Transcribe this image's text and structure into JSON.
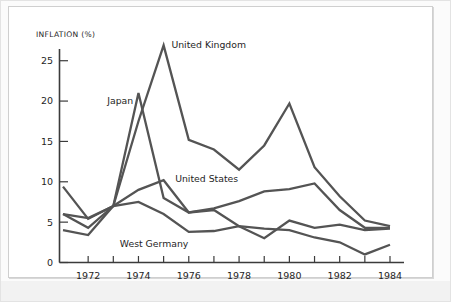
{
  "chart_data": {
    "type": "line",
    "title": "",
    "subtitle": "",
    "xlabel": "",
    "ylabel": "INFLATION (%)",
    "ylim": [
      0,
      28
    ],
    "xlim": [
      1971,
      1984
    ],
    "grid": false,
    "legend_position": "inline-annotations",
    "y_ticks": [
      "0",
      "5",
      "10",
      "15",
      "20",
      "25"
    ],
    "y_tick_values": [
      0,
      5,
      10,
      15,
      20,
      25
    ],
    "x_ticks": [
      "1972",
      "1974",
      "1976",
      "1978",
      "1980",
      "1982",
      "1984"
    ],
    "x_tick_values": [
      1972,
      1974,
      1976,
      1978,
      1980,
      1982,
      1984
    ],
    "x_minor_tick_values": [
      1971,
      1972,
      1973,
      1974,
      1975,
      1976,
      1977,
      1978,
      1979,
      1980,
      1981,
      1982,
      1983,
      1984
    ],
    "x": [
      1971,
      1972,
      1973,
      1974,
      1975,
      1976,
      1977,
      1978,
      1979,
      1980,
      1981,
      1982,
      1983,
      1984
    ],
    "series": [
      {
        "name": "United Kingdom",
        "color": "#545454",
        "label_x": 1975.15,
        "label_y": 26.9,
        "values": [
          4.0,
          3.4,
          7.0,
          17.5,
          26.9,
          15.2,
          14.0,
          11.5,
          14.5,
          19.7,
          11.8,
          8.2,
          5.2,
          4.5
        ]
      },
      {
        "name": "Japan",
        "color": "#545454",
        "label_x": 1972.6,
        "label_y": 20.0,
        "values": [
          6.0,
          4.3,
          7.0,
          21.0,
          8.0,
          6.2,
          6.5,
          4.5,
          3.0,
          5.2,
          4.3,
          4.7,
          4.0,
          4.2
        ]
      },
      {
        "name": "United States",
        "color": "#545454",
        "label_x": 1975.3,
        "label_y": 10.3,
        "values": [
          9.4,
          5.4,
          7.0,
          9.0,
          10.2,
          6.2,
          6.7,
          7.6,
          8.8,
          9.1,
          9.8,
          6.5,
          4.3,
          4.3
        ]
      },
      {
        "name": "West Germany",
        "color": "#545454",
        "label_x": 1973.1,
        "label_y": 2.3,
        "values": [
          6.0,
          5.5,
          7.0,
          7.5,
          6.0,
          3.8,
          3.9,
          4.5,
          4.2,
          4.0,
          3.1,
          2.5,
          1.0,
          2.2
        ]
      }
    ]
  }
}
